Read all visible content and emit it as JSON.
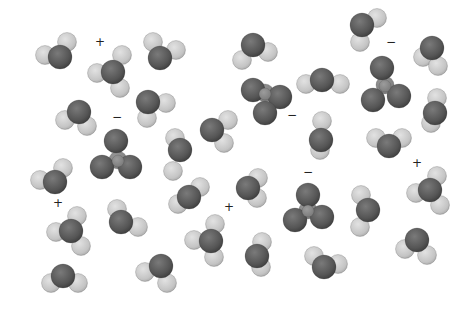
{
  "figure": {
    "colors": {
      "oxygen": "#5a5a5a",
      "hydrogen": "#c8c8c8",
      "center": "#8a8a8a",
      "stroke": "#444444"
    }
  },
  "charges": [
    {
      "symbol": "+",
      "x": 95,
      "y": 42
    },
    {
      "symbol": "−",
      "x": 112,
      "y": 117
    },
    {
      "symbol": "−",
      "x": 287,
      "y": 115
    },
    {
      "symbol": "−",
      "x": 386,
      "y": 42
    },
    {
      "symbol": "−",
      "x": 303,
      "y": 172
    },
    {
      "symbol": "+",
      "x": 53,
      "y": 203
    },
    {
      "symbol": "+",
      "x": 224,
      "y": 207
    },
    {
      "symbol": "+",
      "x": 412,
      "y": 163
    }
  ],
  "molecules": [
    {
      "type": "water",
      "o": [
        60,
        57
      ],
      "h": [
        [
          45,
          55
        ],
        [
          67,
          42
        ]
      ]
    },
    {
      "type": "hydronium",
      "o": [
        113,
        72
      ],
      "h": [
        [
          97,
          73
        ],
        [
          122,
          55
        ],
        [
          120,
          88
        ]
      ]
    },
    {
      "type": "water",
      "o": [
        160,
        58
      ],
      "h": [
        [
          153,
          42
        ],
        [
          176,
          50
        ]
      ]
    },
    {
      "type": "water",
      "o": [
        253,
        45
      ],
      "h": [
        [
          242,
          60
        ],
        [
          268,
          52
        ]
      ]
    },
    {
      "type": "water",
      "o": [
        362,
        25
      ],
      "h": [
        [
          377,
          18
        ],
        [
          360,
          42
        ]
      ]
    },
    {
      "type": "water",
      "o": [
        432,
        48
      ],
      "h": [
        [
          423,
          57
        ],
        [
          438,
          66
        ]
      ]
    },
    {
      "type": "water",
      "o": [
        79,
        112
      ],
      "h": [
        [
          65,
          120
        ],
        [
          87,
          126
        ]
      ]
    },
    {
      "type": "water",
      "o": [
        148,
        102
      ],
      "h": [
        [
          166,
          103
        ],
        [
          147,
          118
        ]
      ]
    },
    {
      "type": "water",
      "o": [
        212,
        130
      ],
      "h": [
        [
          228,
          120
        ],
        [
          224,
          143
        ]
      ]
    },
    {
      "type": "oxyanion",
      "c": [
        265,
        93
      ],
      "o": [
        [
          253,
          90
        ],
        [
          280,
          97
        ],
        [
          265,
          113
        ]
      ]
    },
    {
      "type": "water",
      "o": [
        322,
        80
      ],
      "h": [
        [
          306,
          84
        ],
        [
          340,
          84
        ]
      ]
    },
    {
      "type": "oxyanion",
      "c": [
        385,
        85
      ],
      "o": [
        [
          382,
          68
        ],
        [
          373,
          100
        ],
        [
          399,
          96
        ]
      ]
    },
    {
      "type": "water",
      "o": [
        435,
        113
      ],
      "h": [
        [
          437,
          98
        ],
        [
          431,
          123
        ]
      ]
    },
    {
      "type": "oxyanion",
      "c": [
        118,
        160
      ],
      "o": [
        [
          116,
          141
        ],
        [
          102,
          167
        ],
        [
          130,
          167
        ]
      ]
    },
    {
      "type": "water",
      "o": [
        180,
        150
      ],
      "h": [
        [
          175,
          138
        ],
        [
          173,
          171
        ]
      ]
    },
    {
      "type": "water",
      "o": [
        321,
        140
      ],
      "h": [
        [
          322,
          121
        ],
        [
          320,
          150
        ]
      ]
    },
    {
      "type": "water",
      "o": [
        389,
        146
      ],
      "h": [
        [
          376,
          138
        ],
        [
          402,
          138
        ]
      ]
    },
    {
      "type": "water",
      "o": [
        55,
        182
      ],
      "h": [
        [
          40,
          180
        ],
        [
          63,
          168
        ]
      ]
    },
    {
      "type": "water",
      "o": [
        189,
        197
      ],
      "h": [
        [
          200,
          187
        ],
        [
          178,
          204
        ]
      ]
    },
    {
      "type": "water",
      "o": [
        248,
        188
      ],
      "h": [
        [
          258,
          178
        ],
        [
          257,
          198
        ]
      ]
    },
    {
      "type": "oxyanion",
      "c": [
        308,
        210
      ],
      "o": [
        [
          308,
          195
        ],
        [
          295,
          220
        ],
        [
          322,
          217
        ]
      ]
    },
    {
      "type": "water",
      "o": [
        368,
        210
      ],
      "h": [
        [
          361,
          195
        ],
        [
          360,
          227
        ]
      ]
    },
    {
      "type": "hydronium",
      "o": [
        430,
        190
      ],
      "h": [
        [
          416,
          193
        ],
        [
          437,
          176
        ],
        [
          440,
          205
        ]
      ]
    },
    {
      "type": "hydronium",
      "o": [
        71,
        231
      ],
      "h": [
        [
          56,
          232
        ],
        [
          77,
          216
        ],
        [
          81,
          246
        ]
      ]
    },
    {
      "type": "water",
      "o": [
        121,
        222
      ],
      "h": [
        [
          117,
          209
        ],
        [
          138,
          227
        ]
      ]
    },
    {
      "type": "hydronium",
      "o": [
        211,
        241
      ],
      "h": [
        [
          194,
          240
        ],
        [
          215,
          224
        ],
        [
          214,
          257
        ]
      ]
    },
    {
      "type": "water",
      "o": [
        257,
        256
      ],
      "h": [
        [
          262,
          242
        ],
        [
          261,
          267
        ]
      ]
    },
    {
      "type": "water",
      "o": [
        417,
        240
      ],
      "h": [
        [
          405,
          249
        ],
        [
          427,
          255
        ]
      ]
    },
    {
      "type": "water",
      "o": [
        63,
        276
      ],
      "h": [
        [
          51,
          283
        ],
        [
          78,
          283
        ]
      ]
    },
    {
      "type": "water",
      "o": [
        161,
        266
      ],
      "h": [
        [
          145,
          272
        ],
        [
          167,
          283
        ]
      ]
    },
    {
      "type": "water",
      "o": [
        324,
        267
      ],
      "h": [
        [
          314,
          256
        ],
        [
          338,
          264
        ]
      ]
    }
  ]
}
